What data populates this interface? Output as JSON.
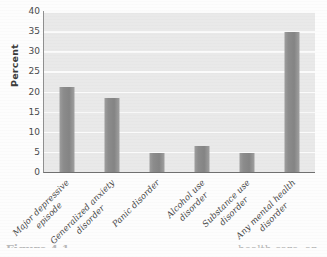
{
  "chart_data": {
    "type": "bar",
    "title": "",
    "xlabel": "",
    "ylabel": "Percent",
    "ylim": [
      0,
      40
    ],
    "yticks": [
      0,
      5,
      10,
      15,
      20,
      25,
      30,
      35,
      40
    ],
    "ytick_labels": [
      "0",
      "5",
      "10",
      "15",
      "20",
      "25",
      "30",
      "35",
      "40"
    ],
    "grid": "horizontal",
    "legend": "none",
    "categories": [
      "Major depressive episode",
      "Generalized anxiety disorder",
      "Panic disorder",
      "Alcohol use disorder",
      "Substance use disorder",
      "Any mental health disorder"
    ],
    "category_lines": [
      [
        "Major depressive",
        "episode"
      ],
      [
        "Generalized anxiety",
        "disorder"
      ],
      [
        "Panic disorder",
        ""
      ],
      [
        "Alcohol use",
        "disorder"
      ],
      [
        "Substance use",
        "disorder"
      ],
      [
        "Any mental health",
        "disorder"
      ]
    ],
    "values": [
      21,
      18.5,
      4.7,
      6.4,
      4.7,
      34.8
    ],
    "bar_color": "#8c8c8c",
    "plot_background": "#e9e9e9",
    "gridline_color": "#fbfbfb",
    "axis_color": "#6f6f6f"
  },
  "caption": {
    "left_fragment": "Figure 4.1",
    "right_fragment": "health care, an"
  }
}
